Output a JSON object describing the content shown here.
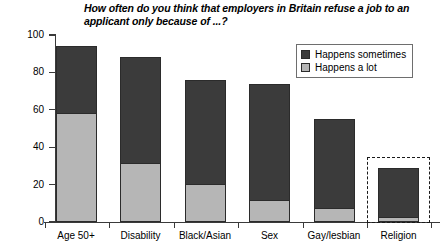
{
  "chart_data": {
    "type": "bar",
    "subtype": "stacked-column",
    "title": "How often do you think that employers in Britain refuse a job to an applicant only because of ...?",
    "xlabel": "",
    "ylabel": "Percentage (%)",
    "ylim": [
      0,
      100
    ],
    "ytick_labels": [
      "0",
      "20",
      "40",
      "60",
      "80",
      "100"
    ],
    "ytick_values": [
      0,
      20,
      40,
      60,
      80,
      100
    ],
    "grid": false,
    "legend_position": "top-right",
    "categories": [
      "Age 50+",
      "Disability",
      "Black/Asian",
      "Sex",
      "Gay/lesbian",
      "Religion"
    ],
    "series": [
      {
        "name": "Happens a lot",
        "color": "#b6b6b6",
        "values": [
          58,
          31,
          20,
          11,
          7,
          2
        ]
      },
      {
        "name": "Happens sometimes",
        "color": "#3b3b3b",
        "values": [
          36,
          57,
          56,
          63,
          48,
          27
        ]
      }
    ],
    "totals": [
      94,
      88,
      76,
      74,
      55,
      29
    ],
    "annotations": [
      {
        "type": "dashed-box",
        "target_category": "Religion",
        "style": "dashed",
        "color": "#1a1a1a"
      }
    ]
  },
  "legend": {
    "items": [
      {
        "label": "Happens sometimes",
        "color": "#3b3b3b"
      },
      {
        "label": "Happens a lot",
        "color": "#b6b6b6"
      }
    ]
  }
}
